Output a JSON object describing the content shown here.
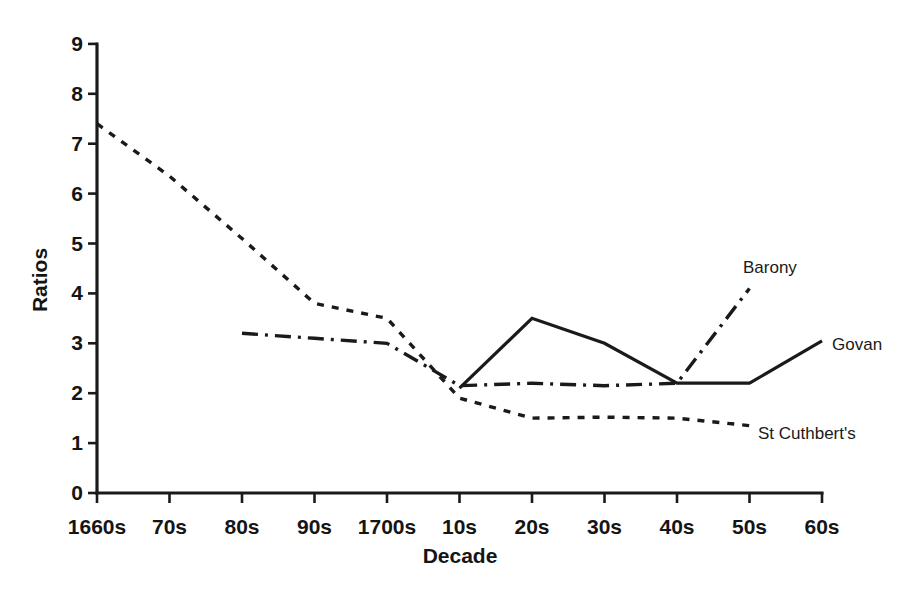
{
  "chart_data": {
    "type": "line",
    "title": "",
    "xlabel": "Decade",
    "ylabel": "Ratios",
    "categories": [
      "1660s",
      "70s",
      "80s",
      "90s",
      "1700s",
      "10s",
      "20s",
      "30s",
      "40s",
      "50s",
      "60s"
    ],
    "ylim": [
      0,
      9
    ],
    "yticks": [
      0,
      1,
      2,
      3,
      4,
      5,
      6,
      7,
      8,
      9
    ],
    "ytick_labels": [
      "0",
      "1",
      "2",
      "3",
      "4",
      "5",
      "6",
      "7",
      "8",
      "9"
    ],
    "grid": false,
    "legend_position": "inline-annotations",
    "series": [
      {
        "name": "Barony",
        "style": "dash-dot",
        "color": "#1a1a1a",
        "x": [
          "80s",
          "90s",
          "1700s",
          "10s",
          "20s",
          "30s",
          "40s",
          "50s"
        ],
        "values": [
          3.2,
          3.1,
          3.0,
          2.15,
          2.2,
          2.15,
          2.2,
          4.1
        ],
        "annotation": "Barony"
      },
      {
        "name": "Govan",
        "style": "solid",
        "color": "#1a1a1a",
        "x": [
          "10s",
          "20s",
          "30s",
          "40s",
          "50s",
          "60s"
        ],
        "values": [
          2.1,
          3.5,
          3.0,
          2.2,
          2.2,
          3.05
        ],
        "annotation": "Govan"
      },
      {
        "name": "St Cuthbert's",
        "style": "dotted",
        "color": "#1a1a1a",
        "x": [
          "1660s",
          "70s",
          "80s",
          "90s",
          "1700s",
          "10s",
          "20s",
          "30s",
          "40s",
          "50s"
        ],
        "values": [
          7.4,
          6.35,
          5.1,
          3.8,
          3.5,
          1.9,
          1.5,
          1.52,
          1.5,
          1.35
        ],
        "annotation": "St Cuthbert's"
      }
    ],
    "annotations": [
      {
        "text": "Barony",
        "x_px": 743,
        "y_px": 258
      },
      {
        "text": "Govan",
        "x_px": 832,
        "y_px": 335
      },
      {
        "text": "St Cuthbert's",
        "x_px": 758,
        "y_px": 424
      }
    ]
  }
}
